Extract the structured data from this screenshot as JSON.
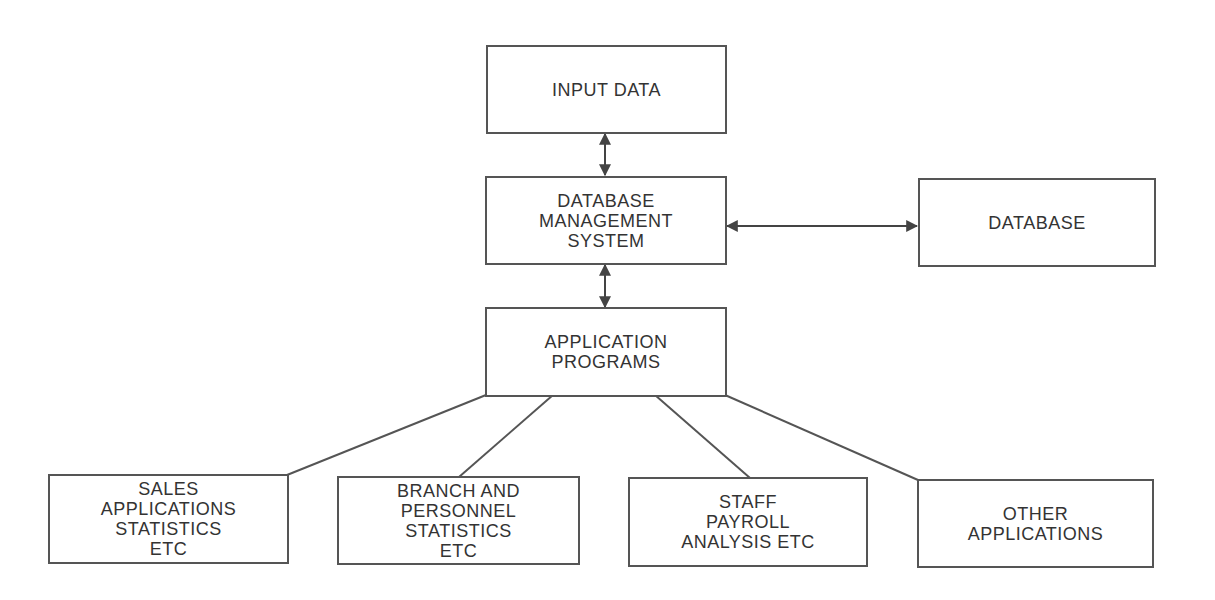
{
  "diagram": {
    "colors": {
      "stroke": "#555555",
      "text": "#333333",
      "background": "#ffffff"
    },
    "nodes": {
      "input_data": {
        "label": "INPUT DATA"
      },
      "dbms": {
        "label": "DATABASE\nMANAGEMENT\nSYSTEM"
      },
      "database": {
        "label": "DATABASE"
      },
      "application_programs": {
        "label": "APPLICATION\nPROGRAMS"
      },
      "sales": {
        "label": "SALES\nAPPLICATIONS\nSTATISTICS\nETC"
      },
      "branch": {
        "label": "BRANCH AND\nPERSONNEL\nSTATISTICS\nETC"
      },
      "staff": {
        "label": "STAFF\nPAYROLL\nANALYSIS ETC"
      },
      "other": {
        "label": "OTHER\nAPPLICATIONS"
      }
    },
    "edges": [
      {
        "from": "input_data",
        "to": "dbms",
        "type": "bidirectional-arrow"
      },
      {
        "from": "dbms",
        "to": "database",
        "type": "bidirectional-arrow"
      },
      {
        "from": "dbms",
        "to": "application_programs",
        "type": "bidirectional-arrow"
      },
      {
        "from": "application_programs",
        "to": "sales",
        "type": "line"
      },
      {
        "from": "application_programs",
        "to": "branch",
        "type": "line"
      },
      {
        "from": "application_programs",
        "to": "staff",
        "type": "line"
      },
      {
        "from": "application_programs",
        "to": "other",
        "type": "line"
      }
    ]
  }
}
